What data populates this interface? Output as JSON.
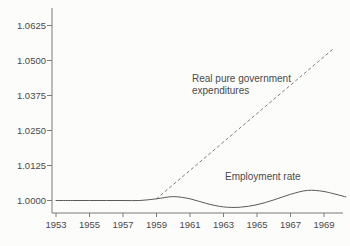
{
  "figure": {
    "background_color": "#fcfcfb",
    "axis_color": "#7a7a7a",
    "text_color": "#4a4a4a"
  },
  "chart_data": {
    "type": "line",
    "title": "",
    "xlabel": "",
    "ylabel": "",
    "grid": false,
    "legend_position": "inline-annotations",
    "xlim": [
      1952.7,
      1970.45
    ],
    "ylim": [
      0.9955,
      1.0688
    ],
    "x_ticks": [
      1953,
      1955,
      1957,
      1959,
      1961,
      1963,
      1965,
      1967,
      1969
    ],
    "x_tick_labels": [
      "1953",
      "1955",
      "1957",
      "1959",
      "1961",
      "1963",
      "1965",
      "1967",
      "1969"
    ],
    "y_ticks": [
      1.0,
      1.0125,
      1.025,
      1.0375,
      1.05,
      1.0625
    ],
    "y_tick_labels": [
      "1.0000",
      "1.0125",
      "1.0250",
      "1.0375",
      "1.0500",
      "1.0625"
    ],
    "series": [
      {
        "name": "Real pure government expenditures",
        "style": "dashed",
        "smooth": false,
        "color": "#6e6e6e",
        "stroke_width": 0.9,
        "dash": "2.5 3.2",
        "points": [
          [
            1959,
            1.0006
          ],
          [
            1969.62,
            1.0545
          ]
        ]
      },
      {
        "name": "Employment rate",
        "style": "solid",
        "smooth": true,
        "color": "#5a5a5a",
        "stroke_width": 1,
        "dash": "",
        "points": [
          [
            1953,
            1.0
          ],
          [
            1954,
            1.0
          ],
          [
            1955,
            1.0
          ],
          [
            1956,
            1.0
          ],
          [
            1957,
            1.0
          ],
          [
            1958,
            1.0
          ],
          [
            1959,
            1.0006
          ],
          [
            1960,
            1.0014
          ],
          [
            1961,
            1.0006
          ],
          [
            1962,
            0.9989
          ],
          [
            1963,
            0.9977
          ],
          [
            1964,
            0.9976
          ],
          [
            1965,
            0.9985
          ],
          [
            1966,
            1.0002
          ],
          [
            1967,
            1.0022
          ],
          [
            1968,
            1.0036
          ],
          [
            1969,
            1.0032
          ],
          [
            1970.3,
            1.0013
          ]
        ]
      }
    ],
    "annotations": [
      {
        "name": "gov-expenditures-label",
        "lines": [
          "Real pure government",
          "expenditures"
        ],
        "x_px": 192,
        "y_px": 82,
        "line_height": 12
      },
      {
        "name": "employment-rate-label",
        "lines": [
          "Employment rate"
        ],
        "x_px": 225,
        "y_px": 180,
        "line_height": 12
      }
    ],
    "pixel_layout": {
      "width": 350,
      "height": 246,
      "axis_left_x": 52,
      "axis_bottom_y": 213,
      "axis_top_y": 8,
      "axis_right_x": 343,
      "x_origin_year": 1953,
      "x_px_per_year": 16.75,
      "x_origin_px": 56,
      "y_base_value": 1.0,
      "y_base_px": 200.5,
      "px_per_unit": 2800,
      "y_tick_len": 5,
      "x_tick_len": 4,
      "y_label_right_x": 46,
      "x_label_baseline_y": 228
    }
  }
}
